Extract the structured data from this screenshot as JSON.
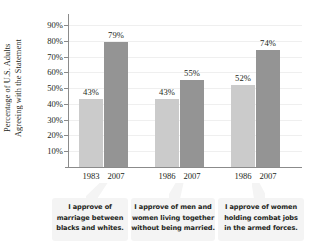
{
  "chart_data": {
    "type": "bar",
    "title": "",
    "subtitle": "",
    "xlabel": "",
    "ylabel": "Percentage of U.S. Adults Agreeing with the Statement",
    "ylabel_lines": [
      "Percentage of U.S. Adults",
      "Agreeing with the Statement"
    ],
    "ylim": [
      0,
      90
    ],
    "ytick_values": [
      90,
      80,
      70,
      60,
      50,
      40,
      30,
      20,
      10
    ],
    "ytick_labels": [
      "90%",
      "80%",
      "70%",
      "60%",
      "50%",
      "40%",
      "30%",
      "20%",
      "10%"
    ],
    "grid": true,
    "legend": "none",
    "categories": [
      "I approve of marriage between blacks and whites.",
      "I approve of men and women living together without being married.",
      "I approve of women holding combat jobs in the armed forces."
    ],
    "groups": [
      {
        "statement_lines": [
          "I approve of",
          "marriage between",
          "blacks and whites."
        ],
        "bars": [
          {
            "x_label": "1983",
            "value": 43,
            "value_label": "43%",
            "color": "#cbcbcb",
            "series": "earlier"
          },
          {
            "x_label": "2007",
            "value": 79,
            "value_label": "79%",
            "color": "#949494",
            "series": "2007"
          }
        ]
      },
      {
        "statement_lines": [
          "I approve of men and",
          "women living together",
          "without being married."
        ],
        "bars": [
          {
            "x_label": "1986",
            "value": 43,
            "value_label": "43%",
            "color": "#cbcbcb",
            "series": "earlier"
          },
          {
            "x_label": "2007",
            "value": 55,
            "value_label": "55%",
            "color": "#949494",
            "series": "2007"
          }
        ]
      },
      {
        "statement_lines": [
          "I approve of women",
          "holding combat jobs",
          "in the armed forces."
        ],
        "bars": [
          {
            "x_label": "1986",
            "value": 52,
            "value_label": "52%",
            "color": "#cbcbcb",
            "series": "earlier"
          },
          {
            "x_label": "2007",
            "value": 74,
            "value_label": "74%",
            "color": "#949494",
            "series": "2007"
          }
        ]
      }
    ],
    "series": [
      {
        "name": "earlier year",
        "values": [
          43,
          43,
          52
        ]
      },
      {
        "name": "2007",
        "values": [
          79,
          55,
          74
        ]
      }
    ],
    "colors": {
      "light_bar": "#cbcbcb",
      "dark_bar": "#949494",
      "axis": "#8b8b8b",
      "gridline": "#efefef",
      "text": "#231f20",
      "caption_box": "#f4f4f4"
    }
  }
}
